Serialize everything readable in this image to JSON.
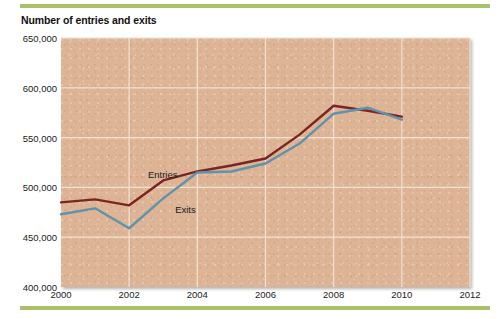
{
  "figure": {
    "title": "Number of entries and exits",
    "top_rule_color": "#a9c16a",
    "bottom_rule_color": "#a9c16a",
    "plot_background_color": "#ddb495",
    "gridline_color": "#f3e2d2"
  },
  "chart_data": {
    "type": "line",
    "title": "Number of entries and exits",
    "xlabel": "",
    "ylabel": "",
    "xlim": [
      2000,
      2012
    ],
    "ylim": [
      400000,
      650000
    ],
    "grid": true,
    "legend": "inline-annotations",
    "x": [
      2000,
      2001,
      2002,
      2003,
      2004,
      2005,
      2006,
      2007,
      2008,
      2009,
      2010
    ],
    "xticks": [
      "2000",
      "2002",
      "2004",
      "2006",
      "2008",
      "2010",
      "2012"
    ],
    "xtick_values": [
      2000,
      2002,
      2004,
      2006,
      2008,
      2010,
      2012
    ],
    "yticks": [
      "400,000",
      "450,000",
      "500,000",
      "550,000",
      "600,000",
      "650,000"
    ],
    "ytick_values": [
      400000,
      450000,
      500000,
      550000,
      600000,
      650000
    ],
    "series": [
      {
        "name": "Entries",
        "color": "#7b2520",
        "label_x": 2002.55,
        "label_y": 518000,
        "values": [
          485000,
          488000,
          482000,
          507000,
          516000,
          522000,
          529000,
          553000,
          582000,
          577000,
          571000
        ]
      },
      {
        "name": "Exits",
        "color": "#5e93ab",
        "label_x": 2003.35,
        "label_y": 483000,
        "values": [
          473000,
          479000,
          459000,
          489000,
          515000,
          516000,
          524000,
          544000,
          574000,
          580000,
          568000
        ]
      }
    ]
  }
}
